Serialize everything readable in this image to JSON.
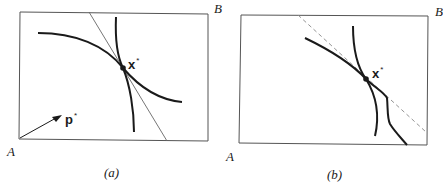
{
  "figure": {
    "panels": [
      {
        "id": "a",
        "caption": "(a)",
        "corner_origin": "A",
        "corner_opposite": "B",
        "point_label": "x",
        "point_superscript": "*",
        "vector_label": "p",
        "vector_superscript": "*",
        "elements": [
          "box",
          "indifference-curve-A",
          "indifference-curve-B",
          "price-line-tangent",
          "price-vector-arrow",
          "equilibrium-point"
        ]
      },
      {
        "id": "b",
        "caption": "(b)",
        "corner_origin": "A",
        "corner_opposite": "B",
        "point_label": "x",
        "point_superscript": "*",
        "elements": [
          "box",
          "smooth-curve",
          "kinked-curve",
          "dashed-tangent-line",
          "equilibrium-point"
        ]
      }
    ],
    "colors": {
      "ink": "#1a1a1a",
      "frame": "#555555",
      "thin_line": "#666666",
      "dashed": "#888888"
    }
  }
}
